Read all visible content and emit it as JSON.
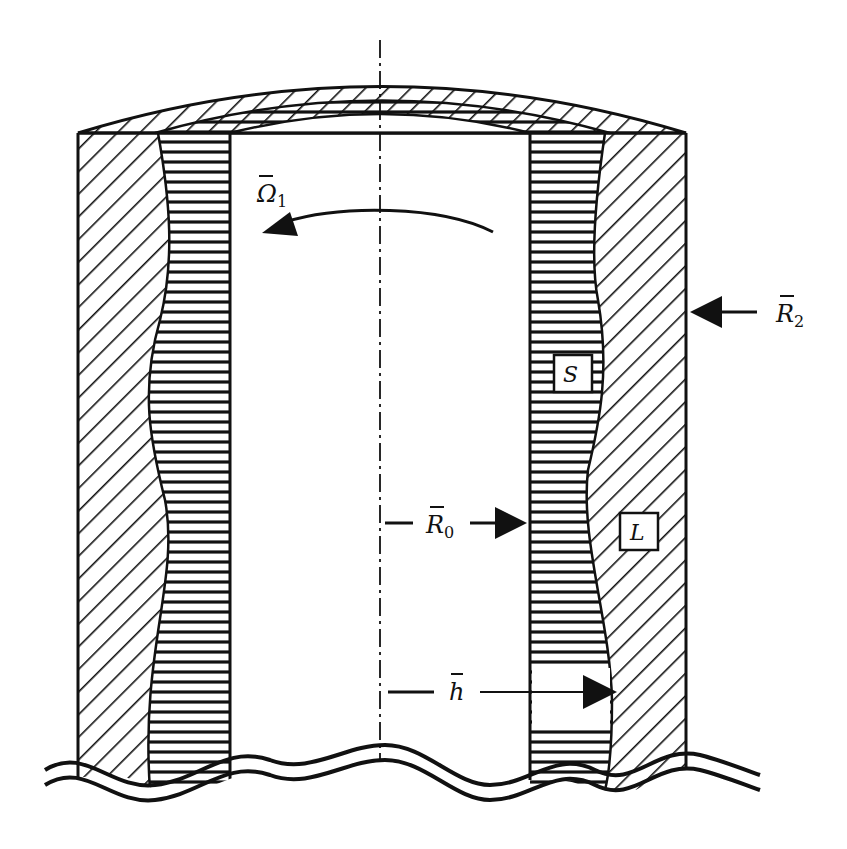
{
  "figure": {
    "colors": {
      "ink": "#111111",
      "background": "#ffffff"
    }
  },
  "labels": {
    "omega": {
      "symbol": "Ω",
      "bar": "‾",
      "subscript": "1"
    },
    "r2": {
      "symbol": "R",
      "subscript": "2"
    },
    "r0": {
      "symbol": "R",
      "subscript": "0"
    },
    "h": {
      "symbol": "h"
    },
    "solid": "S",
    "liquid": "L"
  },
  "regions": [
    {
      "name": "liquid",
      "hatch": "diagonal"
    },
    {
      "name": "solid",
      "hatch": "horizontal"
    },
    {
      "name": "core",
      "hatch": "none"
    }
  ]
}
